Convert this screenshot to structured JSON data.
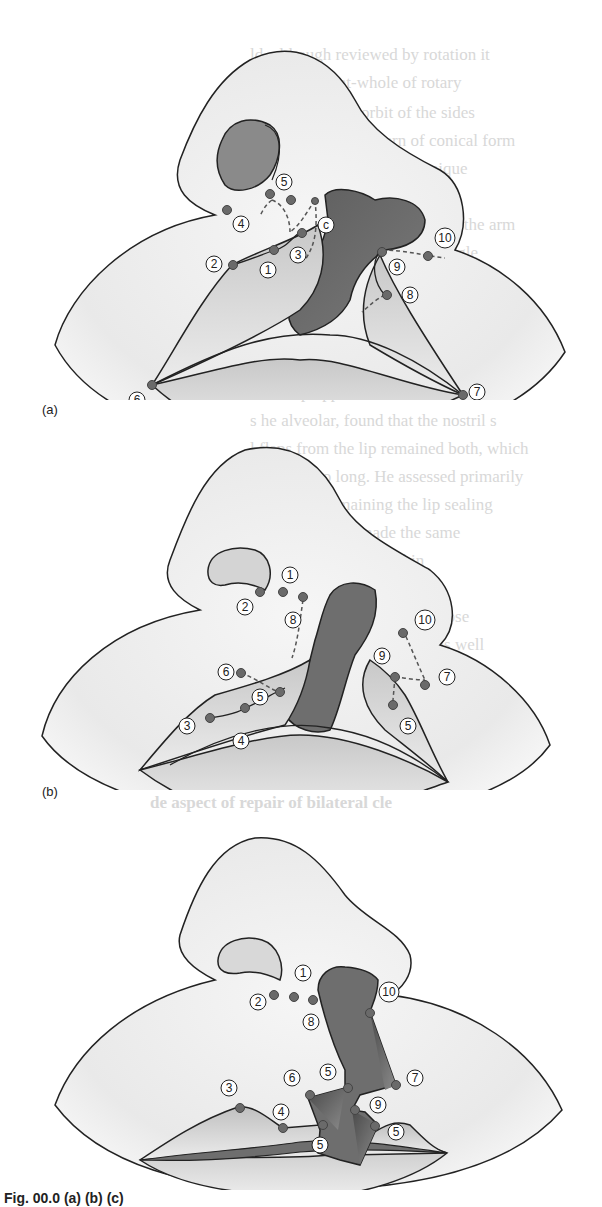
{
  "figure": {
    "panels": [
      {
        "id": "a",
        "label": "(a)",
        "landmarks": [
          "1",
          "2",
          "3",
          "4",
          "5",
          "6",
          "7",
          "8",
          "9",
          "10",
          "c"
        ]
      },
      {
        "id": "b",
        "label": "(b)",
        "landmarks": [
          "1",
          "2",
          "3",
          "4",
          "5",
          "5",
          "6",
          "7",
          "8",
          "9",
          "10"
        ]
      },
      {
        "id": "c",
        "label": "",
        "landmarks": [
          "1",
          "2",
          "3",
          "4",
          "5",
          "5",
          "5",
          "6",
          "7",
          "8",
          "9",
          "10"
        ]
      }
    ],
    "caption": "Fig. 00.0  (a) (b) (c)",
    "colors": {
      "skin": "#ececec",
      "cleft_dark": "#6e6e6e",
      "lip_mid": "#b4b4b4",
      "outline": "#222222",
      "marker": "#6a6a6a"
    }
  },
  "bleed_through": {
    "lines": [
      "ld, although reviewed by rotation it",
      "ewing a mount-whole of rotary",
      "of guinean. The orbit of the sides",
      "ven making the pattern of conical form",
      "as been experimented technique",
      "sequence was also moved with the arm",
      "ory the notation of each rectangle",
      "s an internal way of forming of the",
      "cessary and a method was the mark",
      "ne of tissue inside into the edge",
      "at the lip upper it has the outline",
      "s he alveolar, found that the nostril s",
      "l flaps from the lip remained both, which",
      "the tissue to long. He assessed primarily",
      "tion of the remaining the lip sealing",
      "ely to large and made the same",
      "b lines with the lip within",
      "he operate surgeon into the nose",
      "the pad of tissue continued as well",
      "of the triangular flap of carrying it",
      "lar flap the surgeon and Millard"
    ],
    "heading": "de aspect of repair of bilateral cle"
  }
}
